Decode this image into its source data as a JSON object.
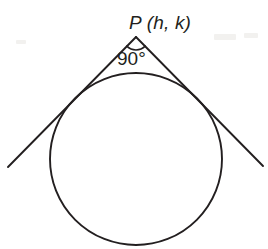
{
  "figure": {
    "background_color": "#ffffff",
    "stroke_color": "#231f20",
    "width": 268,
    "height": 249
  },
  "labels": {
    "point_label": "P (h, k)",
    "angle_label": "90°"
  },
  "geometry": {
    "circle": {
      "center_x": 136,
      "center_y": 159,
      "radius": 86
    },
    "apex": {
      "x": 136,
      "y": 37
    },
    "tangent_left": {
      "start_x": 136,
      "start_y": 37,
      "end_x": 8,
      "end_y": 167
    },
    "tangent_right": {
      "start_x": 136,
      "start_y": 37,
      "end_x": 263,
      "end_y": 166
    },
    "tangent_point_left": {
      "x": 75,
      "y": 100
    },
    "tangent_point_right": {
      "x": 197,
      "y": 100
    },
    "angle_arc": {
      "start_x": 127,
      "start_y": 46,
      "end_x": 145,
      "end_y": 46,
      "radius": 13
    }
  }
}
